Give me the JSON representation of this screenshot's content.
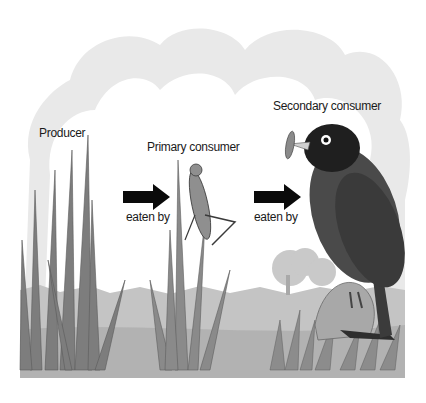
{
  "diagram": {
    "type": "food-chain",
    "colors": {
      "background": "#ffffff",
      "cloud": "#e6e6e6",
      "ground": "#bdbdbd",
      "grass": "#8a8a8a",
      "bird": "#2a2a2a",
      "arrow": "#0a0a0a",
      "text": "#1a1a1a"
    },
    "nodes": [
      {
        "id": "producer",
        "label": "Producer",
        "depicts": "grass"
      },
      {
        "id": "primary",
        "label": "Primary consumer",
        "depicts": "grasshopper"
      },
      {
        "id": "secondary",
        "label": "Secondary consumer",
        "depicts": "bird"
      }
    ],
    "edges": [
      {
        "from": "producer",
        "to": "primary",
        "label": "eaten by"
      },
      {
        "from": "primary",
        "to": "secondary",
        "label": "eaten by"
      }
    ]
  }
}
